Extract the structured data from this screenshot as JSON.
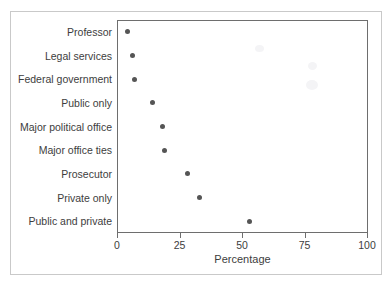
{
  "chart_data": {
    "type": "scatter",
    "plot_style": "dot-plot-horizontal",
    "title": "",
    "subtitle": "",
    "xlabel": "Percentage",
    "ylabel": "",
    "xlim": [
      0,
      100
    ],
    "xticks": [
      0,
      25,
      50,
      75,
      100
    ],
    "xtick_labels": [
      "0",
      "25",
      "50",
      "75",
      "100"
    ],
    "grid": false,
    "legend": null,
    "categories": [
      "Professor",
      "Legal services",
      "Federal government",
      "Public only",
      "Major political office",
      "Major office ties",
      "Prosecutor",
      "Private only",
      "Public and private"
    ],
    "values": [
      4,
      6,
      7,
      14,
      18,
      19,
      28,
      33,
      53
    ],
    "marker": {
      "shape": "circle",
      "color": "#555555",
      "size_px": 5
    },
    "axis_color": "#6e6e6e",
    "text_color": "#3d3d3d",
    "background": "#ffffff",
    "frame_color": "#c9c9c9"
  }
}
